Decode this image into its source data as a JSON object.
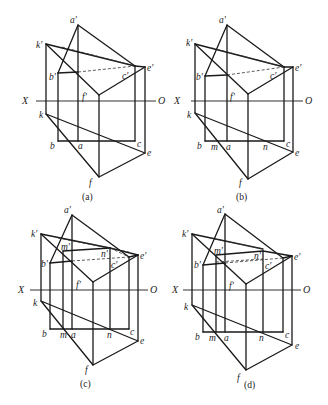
{
  "figure": {
    "axis_labels": {
      "left": "X",
      "right": "O"
    },
    "panels": [
      {
        "id": "a",
        "caption": "(a)",
        "labels": {
          "a1": "a'",
          "k1": "k'",
          "b1": "b'",
          "c1": "c'",
          "e1": "e'",
          "f1": "f'",
          "k": "k",
          "b": "b",
          "a": "a",
          "c": "c",
          "e": "e",
          "f": "f"
        }
      },
      {
        "id": "b",
        "caption": "(b)",
        "labels": {
          "a1": "a'",
          "k1": "k'",
          "b1": "b'",
          "c1": "c'",
          "e1": "e'",
          "f1": "f'",
          "k": "k",
          "b": "b",
          "m": "m",
          "a": "a",
          "n": "n",
          "c": "c",
          "e": "e",
          "f": "f"
        }
      },
      {
        "id": "c",
        "caption": "(c)",
        "labels": {
          "a1": "a'",
          "k1": "k'",
          "m1": "m'",
          "n1": "n'",
          "b1": "b'",
          "c1": "c'",
          "e1": "e'",
          "f1": "f'",
          "k": "k",
          "b": "b",
          "m": "m",
          "a": "a",
          "n": "n",
          "c": "c",
          "e": "e",
          "f": "f"
        }
      },
      {
        "id": "d",
        "caption": "(d)",
        "labels": {
          "a1": "a'",
          "k1": "k'",
          "m1": "m'",
          "n1": "n'",
          "b1": "b'",
          "c1": "c'",
          "e1": "e'",
          "f1": "f'",
          "k": "k",
          "b": "b",
          "m": "m",
          "a": "a",
          "n": "n",
          "c": "c",
          "e": "e",
          "f": "f"
        }
      }
    ]
  }
}
